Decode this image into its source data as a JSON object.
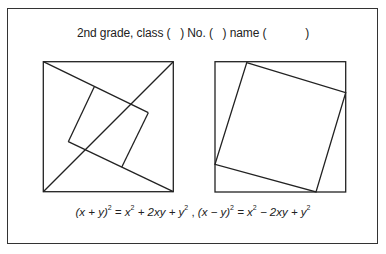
{
  "header": {
    "text": "2nd grade, class (   ) No. (   ) name (            )"
  },
  "figures": {
    "left": {
      "label": "square-with-four-triangles-and-inner-square",
      "outer": [
        43,
        61,
        174,
        193
      ]
    },
    "right": {
      "label": "square-with-inscribed-tilted-square",
      "outer": [
        215,
        61,
        346,
        193
      ]
    }
  },
  "formula": {
    "part1_lhs": "(x + y)",
    "part1_rhs_a": " = x",
    "part1_rhs_b": " + 2xy + y",
    "separator": " , ",
    "part2_lhs": "(x − y)",
    "part2_rhs_a": " = x",
    "part2_rhs_b": " − 2xy + y",
    "exponent": "2"
  },
  "colors": {
    "stroke": "#222222",
    "background": "#ffffff"
  }
}
